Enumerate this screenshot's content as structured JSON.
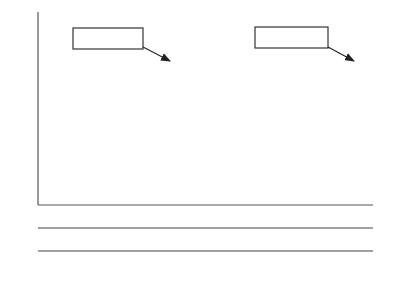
{
  "diagram": {
    "y_axis_label": "f(p",
    "y_axis_sub": "Paper",
    "y_axis_close": ")",
    "null_box": {
      "text_H": "H",
      "text_sub": "o",
      "text_rest": ": π = 0.22"
    },
    "true_box": {
      "text": "True π = 0.29"
    },
    "x_axis_label": "p",
    "x_axis_sub": "Paper",
    "z1_label": "Z",
    "z1_sub": "0.22",
    "z2_label": "Z",
    "z2_sub": "0.29",
    "p_ticks": [
      "0.1768",
      "0.1837",
      "0.22",
      "0.2563",
      "0.2632"
    ],
    "z022_ticks": [
      "−2.33",
      "−1.96",
      "0",
      "1.96",
      "2.33"
    ],
    "z029_ticks": [
      "−5.58",
      "−5.24",
      "−3.45",
      "−1.66",
      "−1.32"
    ]
  },
  "chart_data": {
    "type": "area",
    "title": "",
    "xlabel": "p_Paper",
    "ylabel": "f(p_Paper)",
    "series": [
      {
        "name": "H0: π = 0.22",
        "mean": 0.22,
        "se": 0.01852
      },
      {
        "name": "True π = 0.29",
        "mean": 0.29,
        "se": 0.02108
      }
    ],
    "critical_values_p": [
      0.1768,
      0.1837,
      0.22,
      0.2563,
      0.2632
    ],
    "z_0_22": [
      -2.33,
      -1.96,
      0,
      1.96,
      2.33
    ],
    "z_0_29": [
      -5.58,
      -5.24,
      -3.45,
      -1.66,
      -1.32
    ],
    "shaded_region": "area under True π=0.29 curve left of 0.2563 (Type II error β)"
  }
}
